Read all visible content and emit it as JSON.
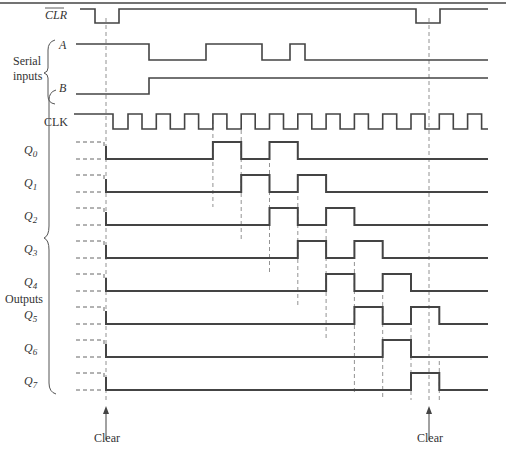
{
  "diagram": {
    "signals": {
      "clr": {
        "label": "CLR",
        "overbar": true
      },
      "a": {
        "label": "A"
      },
      "b": {
        "label": "B"
      },
      "clk": {
        "label": "CLK"
      }
    },
    "groups": {
      "serial_inputs": [
        "Serial",
        "inputs"
      ],
      "outputs": "Outputs"
    },
    "outputs": [
      {
        "label": "Q",
        "sub": "0"
      },
      {
        "label": "Q",
        "sub": "1"
      },
      {
        "label": "Q",
        "sub": "2"
      },
      {
        "label": "Q",
        "sub": "3"
      },
      {
        "label": "Q",
        "sub": "4"
      },
      {
        "label": "Q",
        "sub": "5"
      },
      {
        "label": "Q",
        "sub": "6"
      },
      {
        "label": "Q",
        "sub": "7"
      }
    ],
    "annotations": {
      "clear_left": "Clear",
      "clear_right": "Clear"
    },
    "clock_pulses": 13,
    "a_pattern": "1 until pulse 1; 0; 1 during pulses 4-5; 0; 1 during pulse 7; 0",
    "b_pattern": "0 until pulse 1; 1 thereafter",
    "q0_sequence": [
      0,
      0,
      0,
      0,
      1,
      1,
      0,
      1,
      0,
      0,
      0,
      0,
      0
    ]
  }
}
